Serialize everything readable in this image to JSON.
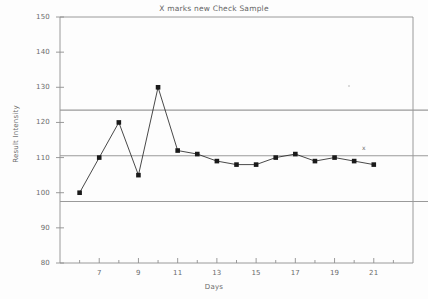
{
  "chart_data": {
    "type": "line",
    "title": "X marks new Check Sample",
    "xlabel": "Days",
    "ylabel": "Result Intensity",
    "xlim": [
      5,
      23
    ],
    "ylim": [
      80,
      150
    ],
    "grid": false,
    "legend_position": "right-inline",
    "x": [
      6,
      7,
      8,
      9,
      10,
      11,
      12,
      13,
      14,
      15,
      16,
      17,
      18,
      19,
      20,
      21
    ],
    "values": [
      100,
      110,
      120,
      105,
      130,
      112,
      111,
      109,
      108,
      108,
      110,
      111,
      109,
      110,
      109,
      108
    ],
    "series": [
      {
        "name": "Result Intensity",
        "marker": "filled-square",
        "values": [
          100,
          110,
          120,
          105,
          130,
          112,
          111,
          109,
          108,
          108,
          110,
          111,
          109,
          110,
          109,
          108
        ]
      }
    ],
    "xticks": [
      7,
      9,
      11,
      13,
      15,
      17,
      19,
      21
    ],
    "xtick_labels": [
      "7",
      "9",
      "11",
      "13",
      "15",
      "17",
      "19",
      "21"
    ],
    "yticks": [
      80,
      90,
      100,
      110,
      120,
      130,
      140,
      150
    ],
    "ytick_labels": [
      "80",
      "90",
      "100",
      "110",
      "120",
      "130",
      "140",
      "150"
    ],
    "reference_lines": [
      {
        "label": "Avg+2Std",
        "value": 123.5
      },
      {
        "label": "Average",
        "value": 110.5
      },
      {
        "label": "Avg-2Std",
        "value": 97.5
      }
    ],
    "annotations": [
      {
        "label": "x",
        "note": "X marks new Check Sample"
      }
    ]
  },
  "colors": {
    "axis": "#8f8f8f",
    "series": "#1a1a1a",
    "reference_line": "#9a9a9a",
    "text": "#6b6b6b",
    "background": "#fdfdfd"
  }
}
